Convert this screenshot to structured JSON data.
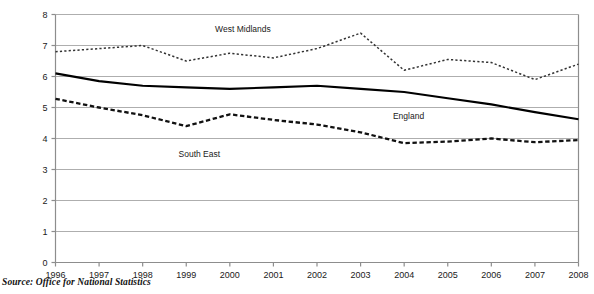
{
  "chart_data": {
    "type": "line",
    "title": "",
    "xlabel": "",
    "ylabel": "",
    "x": [
      1996,
      1997,
      1998,
      1999,
      2000,
      2001,
      2002,
      2003,
      2004,
      2005,
      2006,
      2007,
      2008
    ],
    "xticklabels": [
      "1996",
      "1997",
      "1998",
      "1999",
      "2000",
      "2001",
      "2002",
      "2003",
      "2004",
      "2005",
      "2006",
      "2007",
      "2008"
    ],
    "yticklabels": [
      "0",
      "1",
      "2",
      "3",
      "4",
      "5",
      "6",
      "7",
      "8"
    ],
    "yticks": [
      0,
      1,
      2,
      3,
      4,
      5,
      6,
      7,
      8
    ],
    "ylim": [
      0,
      8
    ],
    "xlim": [
      1996,
      2008
    ],
    "grid": "horizontal",
    "legend_position": "inline-annotations",
    "series": [
      {
        "name": "West Midlands",
        "style": "dotted",
        "color": "#333333",
        "label_x": 2000.3,
        "label_y": 7.45,
        "values": [
          6.8,
          6.9,
          7.0,
          6.5,
          6.75,
          6.6,
          6.9,
          7.4,
          6.2,
          6.55,
          6.45,
          5.9,
          6.4
        ]
      },
      {
        "name": "England",
        "style": "solid",
        "color": "#000000",
        "label_x": 2004.1,
        "label_y": 4.62,
        "values": [
          6.1,
          5.85,
          5.7,
          5.65,
          5.6,
          5.65,
          5.7,
          5.6,
          5.5,
          5.3,
          5.1,
          4.85,
          4.62
        ]
      },
      {
        "name": "South East",
        "style": "dashed",
        "color": "#111111",
        "label_x": 1999.3,
        "label_y": 3.4,
        "values": [
          5.28,
          5.0,
          4.75,
          4.4,
          4.78,
          4.6,
          4.45,
          4.2,
          3.85,
          3.9,
          4.0,
          3.88,
          3.95
        ]
      }
    ]
  },
  "footer": {
    "source": "Source: Office for National Statistics"
  }
}
